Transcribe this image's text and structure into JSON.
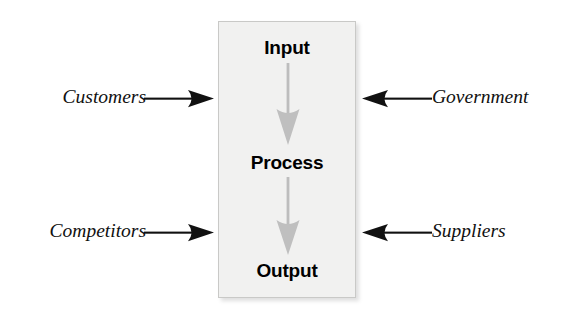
{
  "diagram": {
    "type": "flow-diagram",
    "background_color": "#ffffff"
  },
  "process_box": {
    "fill_color": "#f1f1f0",
    "border_color": "#c9c9c7",
    "stages": [
      {
        "id": "input",
        "label": "Input"
      },
      {
        "id": "process",
        "label": "Process"
      },
      {
        "id": "output",
        "label": "Output"
      }
    ]
  },
  "flow_arrows": {
    "color": "#bfbfbf",
    "direction": "down",
    "count": 2,
    "connections": [
      {
        "from": "Input",
        "to": "Process"
      },
      {
        "from": "Process",
        "to": "Output"
      }
    ]
  },
  "external_factors": {
    "arrow_color": "#111111",
    "left": [
      {
        "id": "customers",
        "label": "Customers",
        "arrow_direction": "right",
        "row": "top"
      },
      {
        "id": "competitors",
        "label": "Competitors",
        "arrow_direction": "right",
        "row": "bottom"
      }
    ],
    "right": [
      {
        "id": "government",
        "label": "Government",
        "arrow_direction": "left",
        "row": "top"
      },
      {
        "id": "suppliers",
        "label": "Suppliers",
        "arrow_direction": "left",
        "row": "bottom"
      }
    ]
  }
}
